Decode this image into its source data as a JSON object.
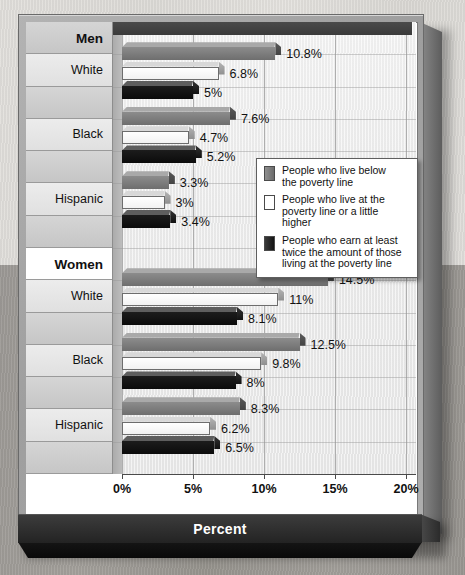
{
  "chart_data": {
    "type": "bar",
    "orientation": "horizontal",
    "title": "",
    "xlabel": "Percent",
    "ylabel": "",
    "xlim": [
      0,
      20
    ],
    "xticks": [
      "0%",
      "5%",
      "10%",
      "15%",
      "20%"
    ],
    "xtick_values": [
      0,
      5,
      10,
      15,
      20
    ],
    "grid": true,
    "legend_position": "center-right",
    "series": [
      {
        "name": "People who live below the poverty line",
        "key": "below",
        "color": "#7b7b7b",
        "values": [
          10.8,
          7.6,
          3.3,
          14.5,
          12.5,
          8.3
        ]
      },
      {
        "name": "People who live at the poverty line or a little higher",
        "key": "at",
        "color": "#ffffff",
        "values": [
          6.8,
          4.7,
          3.0,
          11.0,
          9.8,
          6.2
        ]
      },
      {
        "name": "People who earn at least twice the amount of those living at the poverty line",
        "key": "twice",
        "color": "#111111",
        "values": [
          5.0,
          5.2,
          3.4,
          8.1,
          8.0,
          6.5
        ]
      }
    ],
    "groups": [
      {
        "group": "Men",
        "category": "White",
        "below": 10.8,
        "at": 6.8,
        "twice": 5.0
      },
      {
        "group": "Men",
        "category": "Black",
        "below": 7.6,
        "at": 4.7,
        "twice": 5.2
      },
      {
        "group": "Men",
        "category": "Hispanic",
        "below": 3.3,
        "at": 3.0,
        "twice": 3.4
      },
      {
        "group": "Women",
        "category": "White",
        "below": 14.5,
        "at": 11.0,
        "twice": 8.1
      },
      {
        "group": "Women",
        "category": "Black",
        "below": 12.5,
        "at": 9.8,
        "twice": 8.0
      },
      {
        "group": "Women",
        "category": "Hispanic",
        "below": 8.3,
        "at": 6.2,
        "twice": 6.5
      }
    ],
    "value_labels": [
      "10.8%",
      "6.8%",
      "5%",
      "7.6%",
      "4.7%",
      "5.2%",
      "3.3%",
      "3%",
      "3.4%",
      "14.5%",
      "11%",
      "8.1%",
      "12.5%",
      "9.8%",
      "8%",
      "8.3%",
      "6.2%",
      "6.5%"
    ]
  },
  "rows": [
    {
      "label": "Men",
      "type": "header"
    },
    {
      "label": "White",
      "type": "category"
    },
    {
      "label": "",
      "type": "spacer"
    },
    {
      "label": "Black",
      "type": "category"
    },
    {
      "label": "",
      "type": "spacer"
    },
    {
      "label": "Hispanic",
      "type": "category"
    },
    {
      "label": "",
      "type": "spacer"
    },
    {
      "label": "Women",
      "type": "header"
    },
    {
      "label": "White",
      "type": "category"
    },
    {
      "label": "",
      "type": "spacer"
    },
    {
      "label": "Black",
      "type": "category"
    },
    {
      "label": "",
      "type": "spacer"
    },
    {
      "label": "Hispanic",
      "type": "category"
    },
    {
      "label": "",
      "type": "spacer"
    }
  ],
  "axis": {
    "tick0": "0%",
    "tick1": "5%",
    "tick2": "10%",
    "tick3": "15%",
    "tick4": "20%",
    "title": "Percent"
  },
  "legend": {
    "items": [
      {
        "swatch": "dark-gray",
        "line1": "People who live below",
        "line2": "the poverty line",
        "line3": ""
      },
      {
        "swatch": "white",
        "line1": "People who live at the",
        "line2": "poverty line or a little higher",
        "line3": ""
      },
      {
        "swatch": "black",
        "line1": "People who earn at least",
        "line2": "twice the amount of those",
        "line3": "living at the poverty line"
      }
    ]
  },
  "colors": {
    "series_below": "#7b7b7b",
    "series_at": "#ffffff",
    "series_twice": "#111111",
    "frame": "#a8a8a8",
    "banner": "#2b2b2b",
    "plot_bg": "#eeeeee"
  }
}
